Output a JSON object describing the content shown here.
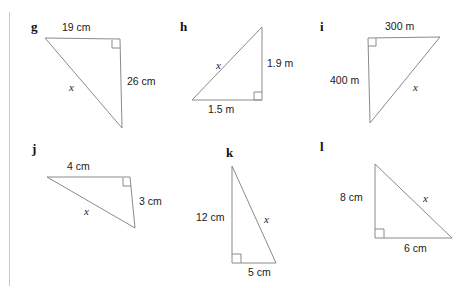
{
  "page": {
    "background_color": "#ffffff",
    "line_color": "#8a8a8a",
    "margin_rule_color": "#c9c9c9",
    "unknown_symbol": "x"
  },
  "figures": [
    {
      "letter": "g",
      "right_angle_corner": "top-right",
      "labels": {
        "side_a": "19 cm",
        "side_b": "26 cm",
        "hypotenuse": "x"
      }
    },
    {
      "letter": "h",
      "right_angle_corner": "bottom-right",
      "labels": {
        "side_a": "1.5 m",
        "side_b": "1.9 m",
        "hypotenuse": "x"
      }
    },
    {
      "letter": "i",
      "right_angle_corner": "top-left",
      "labels": {
        "side_a": "300 m",
        "side_b": "400 m",
        "hypotenuse": "x"
      }
    },
    {
      "letter": "j",
      "right_angle_corner": "top-right",
      "labels": {
        "side_a": "4 cm",
        "side_b": "3 cm",
        "hypotenuse": "x"
      }
    },
    {
      "letter": "k",
      "right_angle_corner": "bottom-left",
      "labels": {
        "side_a": "5 cm",
        "side_b": "12 cm",
        "hypotenuse": "x"
      }
    },
    {
      "letter": "l",
      "right_angle_corner": "bottom-left",
      "labels": {
        "side_a": "6 cm",
        "side_b": "8 cm",
        "hypotenuse": "x"
      }
    }
  ]
}
